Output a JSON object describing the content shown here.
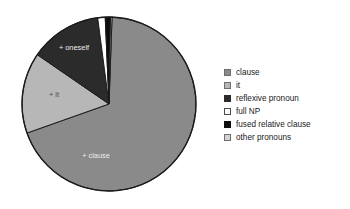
{
  "chart_data": {
    "type": "pie",
    "title": "",
    "subtitle": "",
    "xlabel": "",
    "ylabel": "",
    "grid": false,
    "legend_position": "right",
    "categories": [
      "clause",
      "it",
      "reflexive pronoun",
      "full NP",
      "fused relative clause",
      "other pronouns"
    ],
    "values": [
      68.5,
      15.0,
      13.3,
      1.4,
      1.0,
      0.8
    ],
    "colors": [
      "#8a8a8a",
      "#b7b7b7",
      "#2b2b2b",
      "#ffffff",
      "#0d0d0d",
      "#d2d2d2"
    ],
    "slices": [
      {
        "name": "clause",
        "label": "+ clause",
        "value": 68.5,
        "color": "#8a8a8a",
        "start_angle": 2,
        "end_angle": 250.5,
        "label_shown": true
      },
      {
        "name": "it",
        "label": "+ it",
        "value": 15.0,
        "color": "#b7b7b7",
        "start_angle": 250.5,
        "end_angle": 304.5,
        "label_shown": true
      },
      {
        "name": "reflexive pronoun",
        "label": "+ oneself",
        "value": 13.3,
        "color": "#2b2b2b",
        "start_angle": 304.5,
        "end_angle": 352.5,
        "label_shown": true
      },
      {
        "name": "full NP",
        "label": "",
        "value": 1.4,
        "color": "#ffffff",
        "start_angle": 352.5,
        "end_angle": 357.5,
        "label_shown": false
      },
      {
        "name": "fused relative clause",
        "label": "",
        "value": 1.0,
        "color": "#0d0d0d",
        "start_angle": 357.5,
        "end_angle": 361.0,
        "label_shown": false
      },
      {
        "name": "other pronouns",
        "label": "",
        "value": 0.8,
        "color": "#d2d2d2",
        "start_angle": 361.0,
        "end_angle": 362.0,
        "label_shown": false
      }
    ],
    "slice_labels": [
      {
        "text": "+ oneself",
        "x": 74,
        "y": 48,
        "tone": "on-dark"
      },
      {
        "text": "+ it",
        "x": 54,
        "y": 95,
        "tone": "on-light"
      },
      {
        "text": "+ clause",
        "x": 96,
        "y": 156,
        "tone": "on-dark"
      }
    ],
    "legend": [
      {
        "label": "clause",
        "swatch": "#8a8a8a",
        "border": "#6e6e6e"
      },
      {
        "label": "it",
        "swatch": "#b7b7b7",
        "border": "#6e6e6e"
      },
      {
        "label": "reflexive pronoun",
        "swatch": "#2b2b2b",
        "border": "#2b2b2b"
      },
      {
        "label": "full NP",
        "swatch": "#ffffff",
        "border": "#4a4a4a"
      },
      {
        "label": "fused relative clause",
        "swatch": "#0d0d0d",
        "border": "#0d0d0d"
      },
      {
        "label": "other pronouns",
        "swatch": "#d2d2d2",
        "border": "#6e6e6e"
      }
    ],
    "geometry": {
      "cx": 109,
      "cy": 104,
      "r": 87,
      "outline": "#1c1c1c"
    }
  }
}
